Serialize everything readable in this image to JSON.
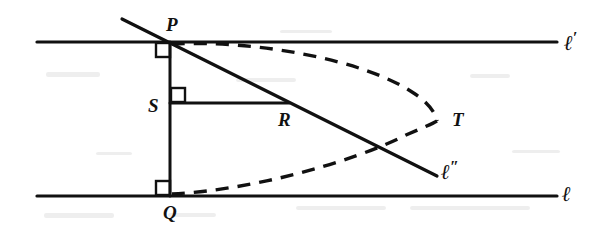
{
  "figure": {
    "type": "geometry-diagram",
    "background_color": "#ffffff",
    "ink_color": "#111111",
    "width": 605,
    "height": 237
  },
  "labels": {
    "P": "P",
    "Q": "Q",
    "S": "S",
    "R": "R",
    "T": "T",
    "l_upper": "ℓ",
    "l_upper_prime": "′",
    "l_lower": "ℓ",
    "l_double": "ℓ",
    "l_double_prime": "″"
  },
  "points": {
    "P": {
      "x": 170,
      "y": 42,
      "label_x": 166,
      "label_y": 15
    },
    "Q": {
      "x": 170,
      "y": 196,
      "label_x": 163,
      "label_y": 203
    },
    "S": {
      "x": 170,
      "y": 103,
      "label_x": 148,
      "label_y": 96
    },
    "R": {
      "x": 287,
      "y": 103,
      "label_x": 278,
      "label_y": 110
    },
    "T": {
      "x": 436,
      "y": 120,
      "label_x": 452,
      "label_y": 110
    }
  },
  "lines": {
    "l_prime_upper": {
      "x1": 37,
      "y1": 42,
      "x2": 557,
      "y2": 42,
      "stroke": 3.2,
      "label_x": 564,
      "label_y": 30
    },
    "l_lower": {
      "x1": 37,
      "y1": 196,
      "x2": 557,
      "y2": 196,
      "stroke": 3.2,
      "label_x": 562,
      "label_y": 184
    },
    "PQ": {
      "x1": 170,
      "y1": 42,
      "x2": 170,
      "y2": 196,
      "stroke": 3.0
    },
    "SR": {
      "x1": 170,
      "y1": 103,
      "x2": 289,
      "y2": 103,
      "stroke": 3.0
    },
    "l_double_ray": {
      "x1": 122,
      "y1": 19,
      "x2": 437,
      "y2": 176,
      "stroke": 3.2,
      "label_x": 441,
      "label_y": 159
    }
  },
  "right_angles": [
    {
      "at": "P",
      "x": 156,
      "y": 43,
      "size": 14
    },
    {
      "at": "Q",
      "x": 156,
      "y": 181,
      "size": 14
    },
    {
      "at": "S",
      "x": 171,
      "y": 88,
      "size": 14
    }
  ],
  "dashed_curves": [
    {
      "name": "upper-equidistant-curve",
      "from": "P",
      "to": "T",
      "path": "M 172 44 C 250 40, 360 58, 412 92 C 428 102, 435 112, 437 121",
      "dash": "13 9",
      "stroke": 3.4
    },
    {
      "name": "lower-equidistant-curve",
      "from": "Q",
      "to": "T",
      "path": "M 172 194 C 250 190, 348 164, 406 135 C 422 128, 432 124, 437 121",
      "dash": "13 9",
      "stroke": 3.4
    }
  ],
  "specks": [
    {
      "x": 46,
      "y": 72,
      "w": 54,
      "h": 5
    },
    {
      "x": 236,
      "y": 78,
      "w": 60,
      "h": 4
    },
    {
      "x": 470,
      "y": 74,
      "w": 40,
      "h": 4
    },
    {
      "x": 44,
      "y": 213,
      "w": 70,
      "h": 5
    },
    {
      "x": 168,
      "y": 213,
      "w": 48,
      "h": 4
    },
    {
      "x": 296,
      "y": 206,
      "w": 90,
      "h": 4
    },
    {
      "x": 410,
      "y": 206,
      "w": 120,
      "h": 4
    },
    {
      "x": 96,
      "y": 152,
      "w": 36,
      "h": 3
    },
    {
      "x": 512,
      "y": 150,
      "w": 48,
      "h": 3
    },
    {
      "x": 280,
      "y": 30,
      "w": 52,
      "h": 3
    }
  ]
}
